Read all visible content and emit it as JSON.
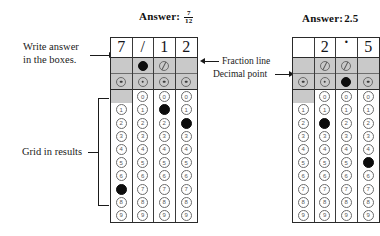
{
  "page": {
    "background": "#ffffff",
    "ink": "#1a1a1a",
    "shade_color": "#c9c9c9",
    "filled_color": "#0d0d0d"
  },
  "annotations": {
    "write_answer": "Write answer\nin the boxes.",
    "write_answer_line1": "Write answer",
    "write_answer_line2": "in the boxes.",
    "grid_in_results": "Grid in results",
    "fraction_line": "Fraction line",
    "decimal_point": "Decimal point"
  },
  "grids": [
    {
      "id": "left-grid",
      "answer_label": "Answer:",
      "answer_value": "7/12",
      "answer_kind": "fraction",
      "answer_numerator": "7",
      "answer_denominator": "12",
      "written": [
        "7",
        "/",
        "1",
        "2"
      ],
      "columns": [
        {
          "index": 1,
          "written": "7",
          "fraction_line_bubble": "none",
          "fraction_line_filled": false,
          "decimal_point_bubble": "dot",
          "decimal_point_filled": false,
          "has_zero": false,
          "digits": [
            "0",
            "1",
            "2",
            "3",
            "4",
            "5",
            "6",
            "7",
            "8",
            "9"
          ],
          "filled_digit": "7"
        },
        {
          "index": 2,
          "written": "/",
          "fraction_line_bubble": "slash",
          "fraction_line_filled": true,
          "decimal_point_bubble": "dot",
          "decimal_point_filled": false,
          "has_zero": true,
          "digits": [
            "0",
            "1",
            "2",
            "3",
            "4",
            "5",
            "6",
            "7",
            "8",
            "9"
          ],
          "filled_digit": null
        },
        {
          "index": 3,
          "written": "1",
          "fraction_line_bubble": "slash",
          "fraction_line_filled": false,
          "decimal_point_bubble": "dot",
          "decimal_point_filled": false,
          "has_zero": true,
          "digits": [
            "0",
            "1",
            "2",
            "3",
            "4",
            "5",
            "6",
            "7",
            "8",
            "9"
          ],
          "filled_digit": "1"
        },
        {
          "index": 4,
          "written": "2",
          "fraction_line_bubble": "none",
          "fraction_line_filled": false,
          "decimal_point_bubble": "dot",
          "decimal_point_filled": false,
          "has_zero": true,
          "digits": [
            "0",
            "1",
            "2",
            "3",
            "4",
            "5",
            "6",
            "7",
            "8",
            "9"
          ],
          "filled_digit": "2"
        }
      ]
    },
    {
      "id": "right-grid",
      "answer_label": "Answer:",
      "answer_value": "2.5",
      "answer_kind": "decimal",
      "written": [
        "",
        "2",
        ".",
        "5"
      ],
      "columns": [
        {
          "index": 1,
          "written": "",
          "fraction_line_bubble": "none",
          "fraction_line_filled": false,
          "decimal_point_bubble": "dot",
          "decimal_point_filled": false,
          "has_zero": false,
          "digits": [
            "0",
            "1",
            "2",
            "3",
            "4",
            "5",
            "6",
            "7",
            "8",
            "9"
          ],
          "filled_digit": null
        },
        {
          "index": 2,
          "written": "2",
          "fraction_line_bubble": "slash",
          "fraction_line_filled": false,
          "decimal_point_bubble": "dot",
          "decimal_point_filled": false,
          "has_zero": true,
          "digits": [
            "0",
            "1",
            "2",
            "3",
            "4",
            "5",
            "6",
            "7",
            "8",
            "9"
          ],
          "filled_digit": "2"
        },
        {
          "index": 3,
          "written": ".",
          "fraction_line_bubble": "slash",
          "fraction_line_filled": false,
          "decimal_point_bubble": "dot",
          "decimal_point_filled": true,
          "has_zero": true,
          "digits": [
            "0",
            "1",
            "2",
            "3",
            "4",
            "5",
            "6",
            "7",
            "8",
            "9"
          ],
          "filled_digit": null
        },
        {
          "index": 4,
          "written": "5",
          "fraction_line_bubble": "none",
          "fraction_line_filled": false,
          "decimal_point_bubble": "dot",
          "decimal_point_filled": false,
          "has_zero": true,
          "digits": [
            "0",
            "1",
            "2",
            "3",
            "4",
            "5",
            "6",
            "7",
            "8",
            "9"
          ],
          "filled_digit": "5"
        }
      ]
    }
  ]
}
